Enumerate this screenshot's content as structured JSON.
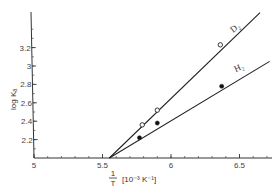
{
  "chart_data": {
    "type": "line",
    "title": "",
    "xlabel": "1/T [10^-3 K^-1]",
    "xlabel_parts": {
      "fraction_num": "1",
      "fraction_den": "T",
      "unit": "[10⁻³ K⁻¹]"
    },
    "ylabel": "log Kₐ",
    "xlim": [
      5.0,
      6.72
    ],
    "ylim": [
      2.0,
      3.58
    ],
    "x_ticks": [
      5,
      5.5,
      6,
      6.5
    ],
    "x_tick_labels": [
      "5",
      "5.5",
      "6",
      "6.5"
    ],
    "x_minor_step": 0.1,
    "y_ticks": [
      2.2,
      2.4,
      2.6,
      2.8,
      3.0,
      3.2
    ],
    "y_tick_labels": [
      "2.2",
      "2.4",
      "2.6",
      "2.8",
      "3",
      "3.2"
    ],
    "y_minor_step": 0.1,
    "grid": false,
    "legend": "inline labels on lines",
    "series": [
      {
        "name": "D₂",
        "marker": "open-circle",
        "points": [
          {
            "x": 5.79,
            "y": 2.36
          },
          {
            "x": 5.9,
            "y": 2.52
          },
          {
            "x": 6.36,
            "y": 3.23
          }
        ],
        "fit_line": {
          "x0": 5.55,
          "y0": 2.0,
          "x1": 6.65,
          "y1": 3.58
        }
      },
      {
        "name": "H₂",
        "marker": "filled-circle",
        "points": [
          {
            "x": 5.77,
            "y": 2.22
          },
          {
            "x": 5.9,
            "y": 2.38
          },
          {
            "x": 6.37,
            "y": 2.78
          }
        ],
        "fit_line": {
          "x0": 5.55,
          "y0": 2.0,
          "x1": 6.72,
          "y1": 3.05
        }
      }
    ]
  },
  "labels": {
    "d2": "D₂",
    "h2": "H₂",
    "ylabel": "log Kₐ",
    "x_frac_num": "1",
    "x_frac_den": "T",
    "x_unit": "[10⁻³ K⁻¹]"
  }
}
